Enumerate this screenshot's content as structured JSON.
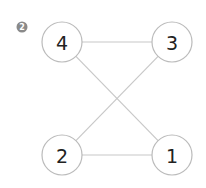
{
  "figure": {
    "badge": {
      "label": "2",
      "x": 22,
      "y": 27,
      "r": 5.5,
      "color": "#8a8a8a"
    },
    "style": {
      "edge_color": "#c8c8c8",
      "node_stroke": "#bbbbbb",
      "node_fill": "#ffffff"
    },
    "nodes": [
      {
        "id": "1",
        "label": "1",
        "x": 172,
        "y": 155
      },
      {
        "id": "2",
        "label": "2",
        "x": 62,
        "y": 155
      },
      {
        "id": "3",
        "label": "3",
        "x": 172,
        "y": 42
      },
      {
        "id": "4",
        "label": "4",
        "x": 62,
        "y": 42
      }
    ],
    "node_radius": 20,
    "edges": [
      {
        "from": "4",
        "to": "3"
      },
      {
        "from": "4",
        "to": "1"
      },
      {
        "from": "3",
        "to": "2"
      },
      {
        "from": "2",
        "to": "1"
      }
    ]
  }
}
